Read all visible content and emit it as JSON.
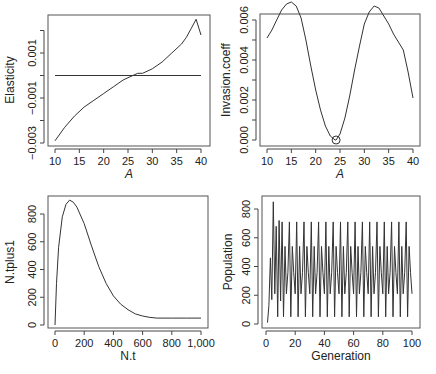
{
  "chart_data": [
    {
      "type": "line",
      "panel": "top-left",
      "title": "",
      "xlabel": "A",
      "ylabel": "Elasticity",
      "xlim": [
        10,
        40
      ],
      "ylim": [
        -0.003,
        0.002
      ],
      "xticks": [
        10,
        15,
        20,
        25,
        30,
        35,
        40
      ],
      "xtick_labels": [
        "10",
        "15",
        "20",
        "25",
        "30",
        "35",
        "40"
      ],
      "yticks": [
        -0.003,
        -0.002,
        -0.001,
        0.0,
        0.001,
        0.002
      ],
      "ytick_labels": [
        "−0.003",
        "",
        "−0.001",
        "",
        "0.001",
        ""
      ],
      "grid": false,
      "series": [
        {
          "name": "elasticity",
          "x": [
            10,
            12,
            14,
            16,
            18,
            20,
            22,
            24,
            25,
            26,
            27,
            28,
            30,
            32,
            34,
            36,
            37,
            38,
            39,
            40
          ],
          "values": [
            -0.0029,
            -0.0023,
            -0.0018,
            -0.0014,
            -0.0011,
            -0.0008,
            -0.0005,
            -0.0002,
            -0.0001,
            0.0,
            0.0001,
            0.0001,
            0.0003,
            0.0006,
            0.001,
            0.0014,
            0.0017,
            0.0021,
            0.0025,
            0.0018
          ]
        },
        {
          "name": "zero-line",
          "x": [
            10,
            40
          ],
          "values": [
            0.0,
            0.0
          ]
        }
      ]
    },
    {
      "type": "line",
      "panel": "top-right",
      "title": "",
      "xlabel": "A",
      "ylabel": "Invasion.coeff",
      "xlim": [
        10,
        40
      ],
      "ylim": [
        0.0,
        0.0068
      ],
      "xticks": [
        10,
        15,
        20,
        25,
        30,
        35,
        40
      ],
      "xtick_labels": [
        "10",
        "15",
        "20",
        "25",
        "30",
        "35",
        "40"
      ],
      "yticks": [
        0.0,
        0.001,
        0.002,
        0.003,
        0.004,
        0.005,
        0.006
      ],
      "ytick_labels": [
        "0.000",
        "",
        "0.002",
        "",
        "0.004",
        "",
        "0.006"
      ],
      "grid": false,
      "annotations": [
        {
          "type": "circle-marker",
          "x": 24.2,
          "y": 0.0
        }
      ],
      "series": [
        {
          "name": "invasion coefficient",
          "x": [
            10,
            11,
            12,
            13,
            14,
            15,
            16,
            17,
            18,
            19,
            20,
            21,
            22,
            23,
            24,
            24.2,
            25,
            26,
            27,
            28,
            29,
            30,
            31,
            32,
            33,
            34,
            35,
            36,
            37,
            38,
            39,
            40
          ],
          "values": [
            0.0051,
            0.0055,
            0.006,
            0.0065,
            0.0068,
            0.0069,
            0.0067,
            0.0061,
            0.005,
            0.0037,
            0.0025,
            0.0015,
            0.0007,
            0.0002,
            0.0,
            0.0,
            0.0003,
            0.0011,
            0.0022,
            0.0035,
            0.0047,
            0.0058,
            0.0064,
            0.0067,
            0.0066,
            0.0062,
            0.0058,
            0.0053,
            0.0049,
            0.0045,
            0.0034,
            0.0021
          ]
        }
      ]
    },
    {
      "type": "line",
      "panel": "bottom-left",
      "title": "",
      "xlabel": "N.t",
      "ylabel": "N.tplus1",
      "xlim": [
        0,
        1000
      ],
      "ylim": [
        0,
        900
      ],
      "xticks": [
        0,
        200,
        400,
        600,
        800,
        1000
      ],
      "xtick_labels": [
        "0",
        "200",
        "400",
        "600",
        "800",
        "1,000"
      ],
      "yticks": [
        0,
        200,
        400,
        600,
        800
      ],
      "ytick_labels": [
        "0",
        "200",
        "400",
        "600",
        "800"
      ],
      "grid": false,
      "series": [
        {
          "name": "recruitment curve",
          "x": [
            0,
            10,
            25,
            50,
            75,
            100,
            125,
            150,
            200,
            250,
            300,
            350,
            400,
            450,
            500,
            550,
            600,
            650,
            700,
            800,
            900,
            1000
          ],
          "values": [
            0,
            300,
            560,
            780,
            870,
            900,
            885,
            850,
            730,
            570,
            420,
            300,
            210,
            150,
            110,
            80,
            65,
            55,
            50,
            50,
            50,
            50
          ]
        }
      ]
    },
    {
      "type": "line",
      "panel": "bottom-right",
      "title": "",
      "xlabel": "Generation",
      "ylabel": "Population",
      "xlim": [
        0,
        100
      ],
      "ylim": [
        0,
        850
      ],
      "xticks": [
        0,
        20,
        40,
        60,
        80,
        100
      ],
      "xtick_labels": [
        "0",
        "20",
        "40",
        "60",
        "80",
        "100"
      ],
      "yticks": [
        0,
        200,
        400,
        600,
        800
      ],
      "ytick_labels": [
        "0",
        "200",
        "400",
        "600",
        "800"
      ],
      "grid": false,
      "series": [
        {
          "name": "population",
          "x": [
            1,
            2,
            3,
            4,
            5,
            6,
            7,
            8,
            9,
            10
          ],
          "values": [
            10,
            130,
            460,
            170,
            850,
            210,
            680,
            50,
            720,
            160
          ],
          "note": "After ~generation 6 the series oscillates in a stable multi-point cycle with values approximately 50, 210, 360, 540, 710 repeating through generation 100"
        }
      ],
      "cycle_levels": [
        50,
        210,
        360,
        540,
        710
      ]
    }
  ]
}
